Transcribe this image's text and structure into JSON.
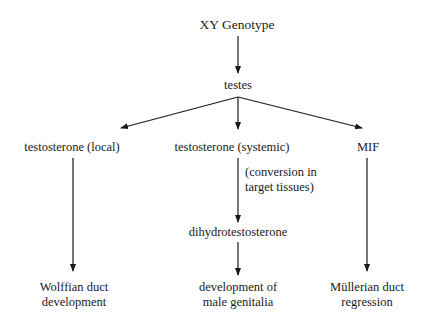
{
  "diagram": {
    "root": "XY Genotype",
    "level1": "testes",
    "branches": [
      {
        "label": "testosterone (local)",
        "outcome": [
          "Wolffian duct",
          "development"
        ]
      },
      {
        "label": "testosterone (systemic)",
        "annotation": [
          "(conversion in",
          "target tissues)"
        ],
        "intermediate": "dihydrotestosterone",
        "outcome": [
          "development of",
          "male genitalia"
        ]
      },
      {
        "label": "MIF",
        "outcome": [
          "Müllerian duct",
          "regression"
        ]
      }
    ]
  },
  "colors": {
    "line": "#1a1a1a",
    "background": "#ffffff"
  }
}
